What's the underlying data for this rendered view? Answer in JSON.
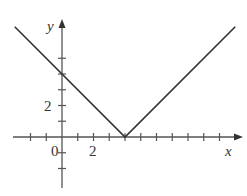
{
  "chart_data": {
    "type": "line",
    "title": "",
    "xlabel": "x",
    "ylabel": "y",
    "function": "y = |x - 4|",
    "series": [
      {
        "name": "y = |x - 4|",
        "x": [
          -3,
          4,
          11
        ],
        "y": [
          7,
          0,
          7
        ],
        "color": "#333333"
      }
    ],
    "xlim": [
      -3,
      11.5
    ],
    "ylim": [
      -3,
      7.5
    ],
    "x_ticks": [
      -2,
      -1,
      1,
      2,
      3,
      4,
      5,
      6,
      7,
      8,
      9,
      10
    ],
    "y_ticks": [
      -2,
      -1,
      1,
      2,
      3,
      4,
      5
    ],
    "x_tick_labels": [
      {
        "value": 0,
        "label": "0"
      },
      {
        "value": 2,
        "label": "2"
      }
    ],
    "y_tick_labels": [
      {
        "value": 2,
        "label": "2"
      }
    ],
    "grid": false,
    "legend": null
  },
  "labels": {
    "x_axis": "x",
    "y_axis": "y",
    "origin": "0",
    "x_two": "2",
    "y_two": "2"
  },
  "colors": {
    "line": "#333333",
    "axis": "#555555"
  }
}
